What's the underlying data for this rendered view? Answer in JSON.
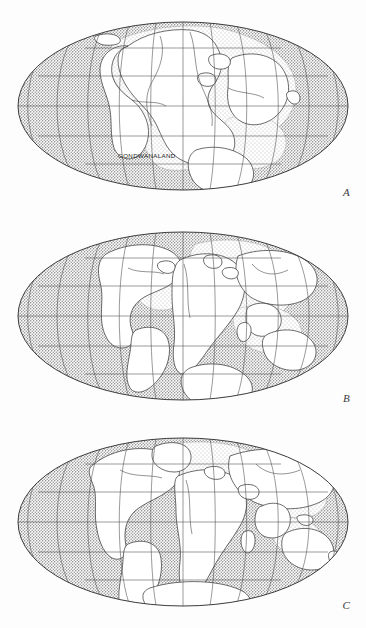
{
  "figure": {
    "projection": "Mollweide (elliptical equal-area)",
    "background_color": "#fdfdfd",
    "ocean_color": "#c9c9c9",
    "land_color": "#ffffff",
    "shelf_color": "#e4e4e4",
    "outline_color": "#3c3c3c",
    "graticule_color": "#4a4a4a",
    "label_color": "#1c1c1c"
  },
  "panels": [
    {
      "id": "A",
      "label": "A",
      "caption_label": "GONDWANALAND",
      "stage": "Gondwanaland supercontinent — landmasses assembled",
      "graticule": {
        "meridian_interval_deg": 30,
        "parallel_interval_deg": 30,
        "meridian_count": 11,
        "parallel_count": 5,
        "parallels_deg": [
          60,
          30,
          0,
          -30,
          -60
        ]
      }
    },
    {
      "id": "B",
      "label": "B",
      "stage": "Early rifting — Atlantic opening begins",
      "graticule": {
        "meridian_interval_deg": 30,
        "parallel_interval_deg": 30,
        "meridian_count": 11,
        "parallel_count": 5,
        "parallels_deg": [
          60,
          30,
          0,
          -30,
          -60
        ]
      }
    },
    {
      "id": "C",
      "label": "C",
      "stage": "Near-modern continental positions",
      "graticule": {
        "meridian_interval_deg": 30,
        "parallel_interval_deg": 30,
        "meridian_count": 11,
        "parallel_count": 5,
        "parallels_deg": [
          60,
          30,
          0,
          -30,
          -60
        ]
      }
    }
  ],
  "ellipse": {
    "center_x": 183,
    "semi_axis_x": 165,
    "semi_axis_y": 84
  }
}
